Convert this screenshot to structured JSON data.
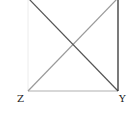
{
  "diagram": {
    "title": "",
    "points": {
      "Z": {
        "label": "Z",
        "x": 28,
        "y": 91
      },
      "Y": {
        "label": "Y",
        "x": 118,
        "y": 91
      },
      "top_left": {
        "label": "",
        "x": 28,
        "y": -2
      },
      "top_right": {
        "label": "",
        "x": 118,
        "y": -2
      }
    },
    "segments": [
      {
        "name": "diagonal-topleft-to-Y",
        "from": "top_left",
        "to": "Y",
        "color": "#555555"
      },
      {
        "name": "diagonal-Z-to-topright",
        "from": "Z",
        "to": "top_right",
        "color": "#9a9a9a"
      },
      {
        "name": "edge-Z-Y",
        "from": "Z",
        "to": "Y",
        "color": "#b0b0b0"
      },
      {
        "name": "edge-right",
        "from": "top_right",
        "to": "Y",
        "color": "#222222"
      },
      {
        "name": "edge-left",
        "from": "top_left",
        "to": "Z",
        "color": "#eeeeee"
      }
    ],
    "labels": {
      "z": "Z",
      "y": "Y"
    }
  }
}
